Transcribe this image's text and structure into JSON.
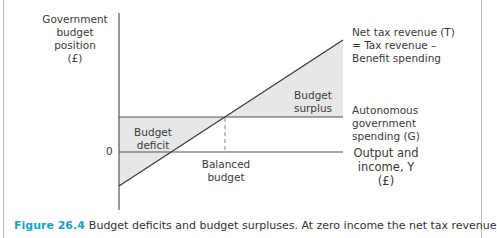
{
  "diagram": {
    "y_axis_label": [
      "Government",
      "budget",
      "position",
      "(£)"
    ],
    "x_axis_label": [
      "Output and",
      "income, Y",
      "(£)"
    ],
    "zero_label": "0",
    "t_line_label": [
      "Net tax revenue (T)",
      "= Tax revenue –",
      "Benefit spending"
    ],
    "g_line_label": [
      "Autonomous",
      "government",
      "spending (G)"
    ],
    "regions": {
      "deficit": [
        "Budget",
        "deficit"
      ],
      "surplus": [
        "Budget",
        "surplus"
      ],
      "balanced": [
        "Balanced",
        "budget"
      ]
    },
    "colors": {
      "shade": "#e6e7e8",
      "line": "#3c3c3c",
      "caption_accent": "#1aa0c8",
      "frame": "#bdbdbd"
    }
  },
  "caption": {
    "figure_number": "Figure 26.4",
    "text": "Budget deficits and budget surpluses. At zero income the net tax revenue"
  }
}
